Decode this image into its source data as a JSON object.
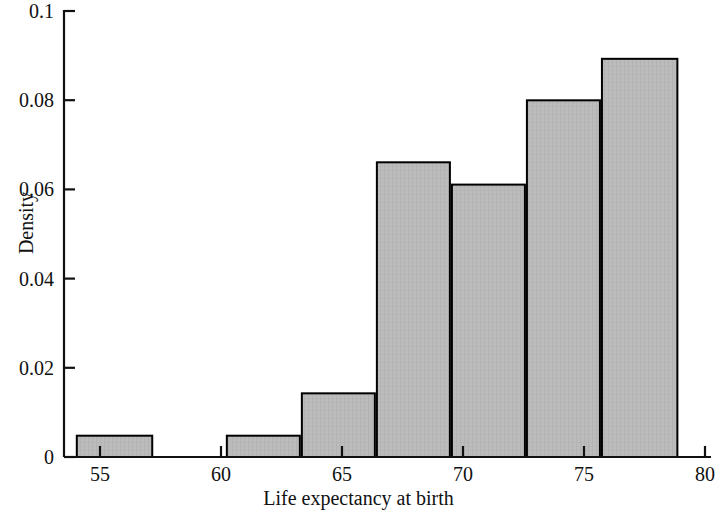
{
  "chart_data": {
    "type": "bar",
    "title": "",
    "subtitle": "",
    "xlabel": "Life expectancy at birth",
    "ylabel": "Density",
    "xlim": [
      53.0,
      81.0
    ],
    "ylim": [
      0,
      0.1
    ],
    "grid": false,
    "legend": null,
    "x_ticks": [
      55,
      60,
      65,
      70,
      75,
      80
    ],
    "x_tick_labels": [
      "55",
      "60",
      "65",
      "70",
      "75",
      "80"
    ],
    "y_ticks": [
      0,
      0.02,
      0.04,
      0.06,
      0.08,
      0.1
    ],
    "y_tick_labels": [
      "0",
      "0.02",
      "0.04",
      "0.06",
      "0.08",
      "0.1"
    ],
    "bar_style": {
      "fill": "#b9b9b9",
      "edge": "#000000",
      "edge_width": 2
    },
    "bins": [
      {
        "x0": 54.0,
        "x1": 57.2,
        "density": 0.005
      },
      {
        "x0": 60.2,
        "x1": 63.3,
        "density": 0.005
      },
      {
        "x0": 63.3,
        "x1": 66.4,
        "density": 0.0145
      },
      {
        "x0": 66.4,
        "x1": 69.5,
        "density": 0.0663
      },
      {
        "x0": 69.5,
        "x1": 72.6,
        "density": 0.0613
      },
      {
        "x0": 72.6,
        "x1": 75.7,
        "density": 0.0802
      },
      {
        "x0": 75.7,
        "x1": 78.9,
        "density": 0.0895
      }
    ]
  },
  "axis": {
    "x_label": "Life expectancy at birth",
    "y_label": "Density"
  }
}
